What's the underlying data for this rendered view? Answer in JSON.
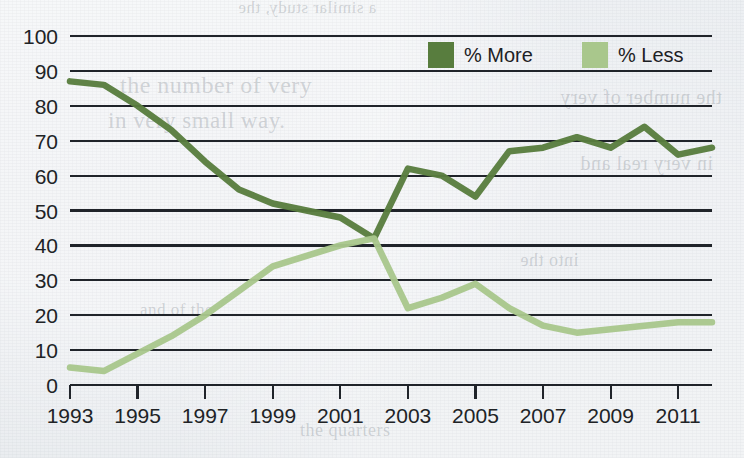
{
  "chart_data": {
    "type": "line",
    "title": "",
    "subtitle": "",
    "xlabel": "",
    "ylabel": "",
    "xlim": [
      1993,
      2012
    ],
    "ylim": [
      0,
      100
    ],
    "grid": true,
    "grid_axis": "y",
    "legend_position": "top-center",
    "x": [
      1993,
      1994,
      1995,
      1996,
      1997,
      1998,
      1999,
      2000,
      2001,
      2002,
      2003,
      2004,
      2005,
      2006,
      2007,
      2008,
      2009,
      2010,
      2011,
      2012
    ],
    "xtick_labels": [
      "1993",
      "1995",
      "1997",
      "1999",
      "2001",
      "2003",
      "2005",
      "2007",
      "2009",
      "2011"
    ],
    "xtick_values": [
      1993,
      1995,
      1997,
      1999,
      2001,
      2003,
      2005,
      2007,
      2009,
      2011
    ],
    "ytick_labels": [
      "0",
      "10",
      "20",
      "30",
      "40",
      "50",
      "60",
      "70",
      "80",
      "90",
      "100"
    ],
    "ytick_values": [
      0,
      10,
      20,
      30,
      40,
      50,
      60,
      70,
      80,
      90,
      100
    ],
    "series": [
      {
        "name": "% More",
        "color": "#587d3e",
        "values": [
          87,
          86,
          80,
          73,
          64,
          56,
          52,
          50,
          48,
          42,
          62,
          60,
          54,
          67,
          68,
          71,
          68,
          74,
          66,
          68
        ]
      },
      {
        "name": "% Less",
        "color": "#a9c78c",
        "values": [
          5,
          4,
          9,
          14,
          20,
          27,
          34,
          37,
          40,
          42,
          22,
          25,
          29,
          22,
          17,
          15,
          16,
          17,
          18,
          18
        ]
      }
    ]
  },
  "legend": {
    "items": [
      {
        "label": "% More",
        "color": "#587d3e"
      },
      {
        "label": "% Less",
        "color": "#a9c78c"
      }
    ]
  },
  "background_text": {
    "lines": [
      "a similar study, the",
      "the number of very",
      "in very small way.",
      "the number of very",
      "in very real and",
      "the quarters",
      "into the",
      "and of the"
    ]
  }
}
